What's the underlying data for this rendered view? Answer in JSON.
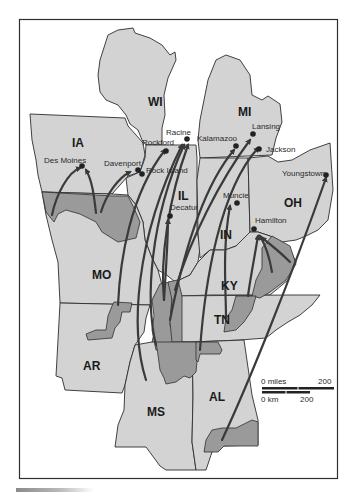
{
  "map": {
    "colors": {
      "state_fill": "#d3d3d3",
      "source_region_fill": "#9a9a9a",
      "border": "#2e2e2e",
      "arrow": "#3a3a3a",
      "background": "#ffffff",
      "frame": "#2e2e2e"
    },
    "states": [
      {
        "abbr": "WI"
      },
      {
        "abbr": "MI"
      },
      {
        "abbr": "IA"
      },
      {
        "abbr": "IL"
      },
      {
        "abbr": "IN"
      },
      {
        "abbr": "OH"
      },
      {
        "abbr": "MO"
      },
      {
        "abbr": "KY"
      },
      {
        "abbr": "TN"
      },
      {
        "abbr": "AR"
      },
      {
        "abbr": "MS"
      },
      {
        "abbr": "AL"
      }
    ],
    "cities": [
      {
        "name": "Des Moines"
      },
      {
        "name": "Davenport"
      },
      {
        "name": "Rock Island"
      },
      {
        "name": "Rockford"
      },
      {
        "name": "Racine"
      },
      {
        "name": "Kalamazoo"
      },
      {
        "name": "Lansing"
      },
      {
        "name": "Jackson"
      },
      {
        "name": "Decatur"
      },
      {
        "name": "Muncie"
      },
      {
        "name": "Hamilton"
      },
      {
        "name": "Youngstown"
      }
    ],
    "scale": {
      "miles_start": "0 miles",
      "miles_end": "200",
      "km_start": "0 km",
      "km_end": "200"
    }
  }
}
